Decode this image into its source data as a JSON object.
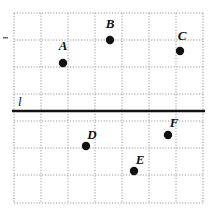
{
  "figure": {
    "background_color": "#ffffff",
    "ink_color": "#111111",
    "grid": {
      "gridline_color": "#9a9a9a",
      "gridline_style": "dotted",
      "border_style": "dotted",
      "x_left_px": 14,
      "x_right_px": 203,
      "y_top_px": 13,
      "y_bottom_px": 203,
      "cell_size_px": 27,
      "columns": 7,
      "rows": 7,
      "x_gridlines_px": [
        14,
        41,
        68,
        95,
        122,
        149,
        176,
        203
      ],
      "y_gridlines_px": [
        13,
        40,
        67,
        94,
        121,
        148,
        175,
        203
      ]
    },
    "line": {
      "label": "l",
      "label_x_px": 18,
      "label_y_px": 106,
      "color": "#111111",
      "thickness_px": 2.4,
      "y_px": 111,
      "x_start_px": 12,
      "x_end_px": 205,
      "orientation": "horizontal",
      "description": "solid horizontal line crossing entire grid"
    },
    "edge_tick": {
      "name": "left-edge-tick",
      "x_px": 3,
      "y_px": 37,
      "width_px": 5,
      "height_px": 1.5,
      "color": "#6a6a6a"
    },
    "points": [
      {
        "label": "A",
        "x_px": 63,
        "y_px": 63,
        "radius_px": 4.2,
        "label_x_px": 63,
        "label_y_px": 50,
        "label_anchor": "middle",
        "grid_x": 1.8,
        "grid_y": 1.85,
        "position_note": "above line l, left-center of grid"
      },
      {
        "label": "B",
        "x_px": 110,
        "y_px": 40,
        "radius_px": 4.2,
        "label_x_px": 110,
        "label_y_px": 28,
        "label_anchor": "middle",
        "grid_x": 3.55,
        "grid_y": 1.0,
        "position_note": "above line l, top-center of grid"
      },
      {
        "label": "C",
        "x_px": 180,
        "y_px": 51,
        "radius_px": 4.2,
        "label_x_px": 182,
        "label_y_px": 40,
        "label_anchor": "middle",
        "grid_x": 6.15,
        "grid_y": 1.4,
        "position_note": "above line l, top-right of grid"
      },
      {
        "label": "D",
        "x_px": 86,
        "y_px": 146,
        "radius_px": 4.2,
        "label_x_px": 92,
        "label_y_px": 139,
        "label_anchor": "middle",
        "grid_x": 2.67,
        "grid_y": 4.93,
        "position_note": "below line l, lower-left of grid"
      },
      {
        "label": "E",
        "x_px": 134,
        "y_px": 171,
        "radius_px": 4.2,
        "label_x_px": 140,
        "label_y_px": 164,
        "label_anchor": "middle",
        "grid_x": 4.44,
        "grid_y": 5.85,
        "position_note": "below line l, bottom-center of grid"
      },
      {
        "label": "F",
        "x_px": 168,
        "y_px": 135,
        "radius_px": 4.2,
        "label_x_px": 174,
        "label_y_px": 127,
        "label_anchor": "middle",
        "grid_x": 5.7,
        "grid_y": 4.52,
        "position_note": "below line l, right side of grid"
      }
    ]
  }
}
